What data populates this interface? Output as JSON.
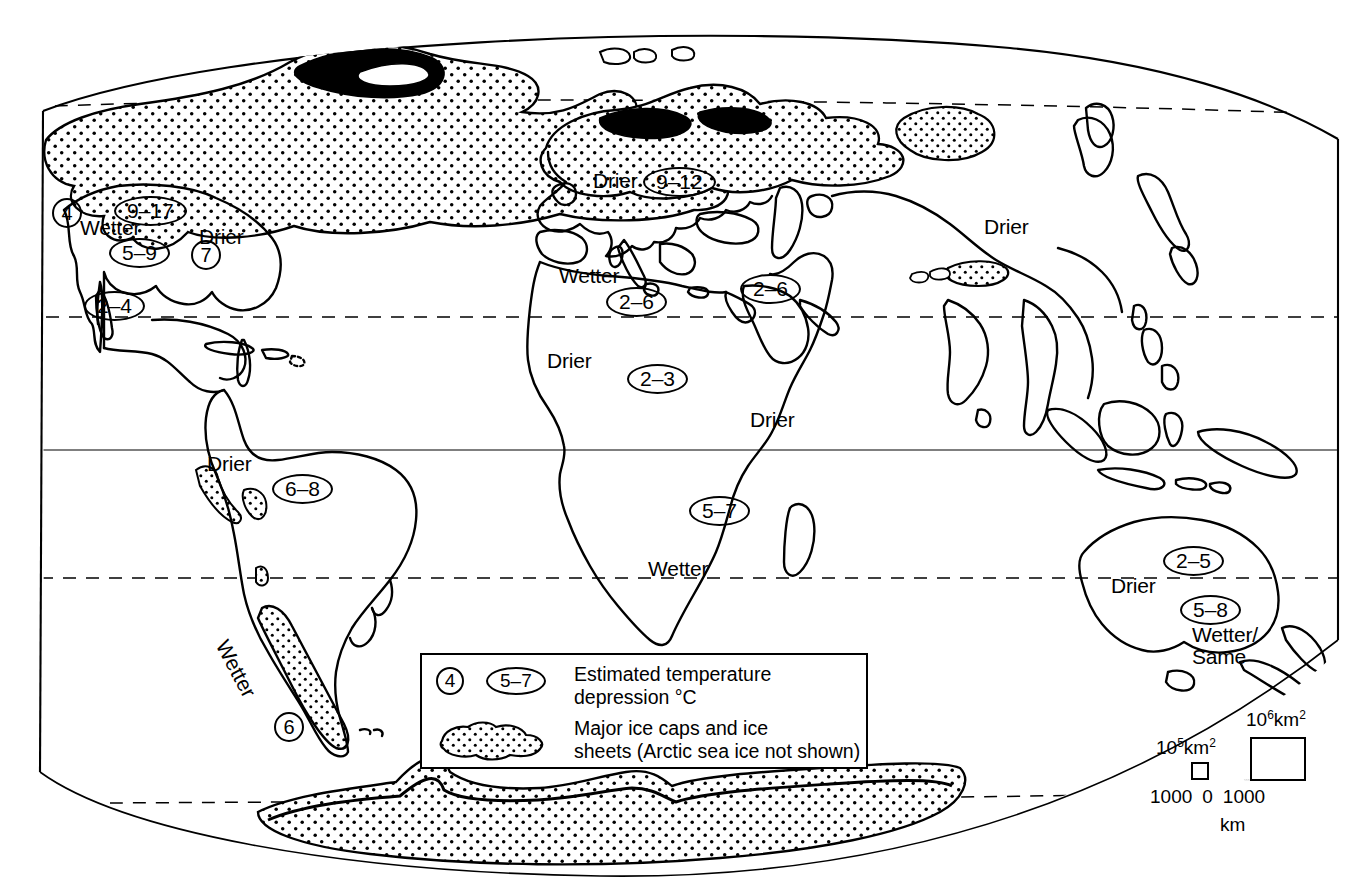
{
  "map": {
    "title": "Last Glacial Maximum world map",
    "projection": "oval / elliptical world projection",
    "colors": {
      "ink": "#000000",
      "background": "#ffffff",
      "stipple": "#000000"
    },
    "latitude_lines": [
      {
        "name": "arctic-circle",
        "style": "dashed"
      },
      {
        "name": "tropic-of-cancer",
        "style": "dashed"
      },
      {
        "name": "equator",
        "style": "solid"
      },
      {
        "name": "tropic-of-capricorn",
        "style": "dashed"
      },
      {
        "name": "antarctic-circle",
        "style": "dashed"
      }
    ]
  },
  "annotations": [
    {
      "id": "na-west-4",
      "kind": "value-round",
      "value": "4",
      "x": 52,
      "y": 198
    },
    {
      "id": "na-wetter",
      "kind": "text",
      "value": "Wetter",
      "x": 80,
      "y": 217
    },
    {
      "id": "laurentide-9-17",
      "kind": "value-oval",
      "value": "9–17",
      "x": 114,
      "y": 196
    },
    {
      "id": "na-east-drier",
      "kind": "text",
      "value": "Drier",
      "x": 199,
      "y": 226
    },
    {
      "id": "na-5-9",
      "kind": "value-oval",
      "value": "5–9",
      "x": 109,
      "y": 238
    },
    {
      "id": "na-se-7",
      "kind": "value-round",
      "value": "7",
      "x": 191,
      "y": 240
    },
    {
      "id": "na-sw-2-4",
      "kind": "value-oval",
      "value": "2–4",
      "x": 84,
      "y": 291
    },
    {
      "id": "eurasia-drier",
      "kind": "text",
      "value": "Drier",
      "x": 593,
      "y": 170
    },
    {
      "id": "fennoscandian-9-12",
      "kind": "value-oval",
      "value": "9–12",
      "x": 643,
      "y": 167
    },
    {
      "id": "asia-drier",
      "kind": "text",
      "value": "Drier",
      "x": 984,
      "y": 216
    },
    {
      "id": "medit-wetter",
      "kind": "text",
      "value": "Wetter",
      "x": 559,
      "y": 265
    },
    {
      "id": "medit-2-6",
      "kind": "value-oval",
      "value": "2–6",
      "x": 606,
      "y": 287
    },
    {
      "id": "arabia-2-6",
      "kind": "value-oval",
      "value": "2–6",
      "x": 740,
      "y": 274
    },
    {
      "id": "sahara-drier",
      "kind": "text",
      "value": "Drier",
      "x": 547,
      "y": 350
    },
    {
      "id": "sahara-2-3",
      "kind": "value-oval",
      "value": "2–3",
      "x": 627,
      "y": 364
    },
    {
      "id": "e-africa-drier",
      "kind": "text",
      "value": "Drier",
      "x": 750,
      "y": 409
    },
    {
      "id": "s-africa-5-7",
      "kind": "value-oval",
      "value": "5–7",
      "x": 689,
      "y": 496
    },
    {
      "id": "s-africa-wetter",
      "kind": "text",
      "value": "Wetter",
      "x": 648,
      "y": 558
    },
    {
      "id": "samerica-drier",
      "kind": "text",
      "value": "Drier",
      "x": 207,
      "y": 453
    },
    {
      "id": "samerica-6-8",
      "kind": "value-oval",
      "value": "6–8",
      "x": 272,
      "y": 474
    },
    {
      "id": "andes-wetter",
      "kind": "rotated-text",
      "value": "Wetter",
      "x": 232,
      "y": 636,
      "rotation": 62
    },
    {
      "id": "patagonia-6",
      "kind": "value-round",
      "value": "6",
      "x": 274,
      "y": 712
    },
    {
      "id": "australia-2-5",
      "kind": "value-oval",
      "value": "2–5",
      "x": 1163,
      "y": 546
    },
    {
      "id": "australia-drier",
      "kind": "text",
      "value": "Drier",
      "x": 1111,
      "y": 575
    },
    {
      "id": "australia-5-8",
      "kind": "value-oval",
      "value": "5–8",
      "x": 1180,
      "y": 595
    },
    {
      "id": "nz-wetter-same-1",
      "kind": "text",
      "value": "Wetter/",
      "x": 1192,
      "y": 624
    },
    {
      "id": "nz-wetter-same-2",
      "kind": "text",
      "value": "Same",
      "x": 1192,
      "y": 646
    }
  ],
  "legend": {
    "temp_symbol_round": "4",
    "temp_symbol_oval": "5–7",
    "temp_text_line1": "Estimated temperature",
    "temp_text_line2": "depression °C",
    "ice_text_line1": "Major ice caps and ice",
    "ice_text_line2": "sheets (Arctic sea ice not shown)"
  },
  "scalebar": {
    "small_square_label_base": "10",
    "small_square_label_exp": "5",
    "small_square_label_unit": "km",
    "small_square_label_unit_exp": "2",
    "large_square_label_base": "10",
    "large_square_label_exp": "6",
    "large_square_label_unit": "km",
    "large_square_label_unit_exp": "2",
    "tick_left": "1000",
    "tick_center": "0",
    "tick_right": "1000",
    "unit": "km"
  }
}
